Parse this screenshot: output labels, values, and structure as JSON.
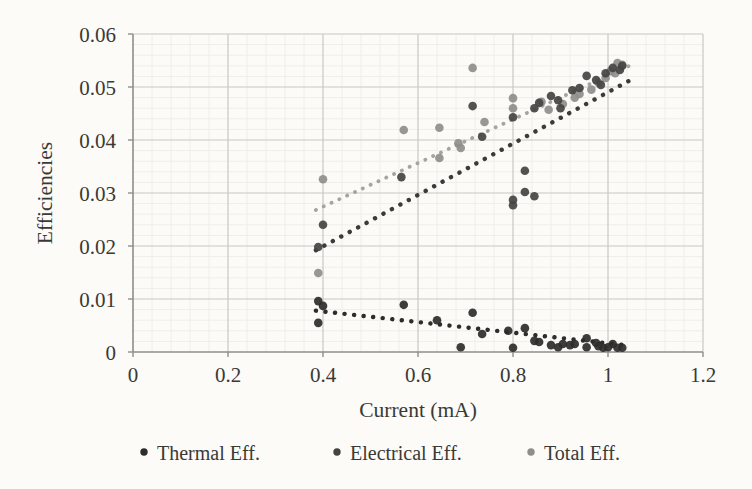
{
  "chart_data": {
    "type": "scatter",
    "title": "",
    "xlabel": "Current (mA)",
    "ylabel": "Efficiencies",
    "xlim": [
      0,
      1.2
    ],
    "ylim": [
      0,
      0.06
    ],
    "x_tick_values": [
      0,
      0.2,
      0.4,
      0.6,
      0.8,
      1,
      1.2
    ],
    "x_tick_labels": [
      "0",
      "0.2",
      "0.4",
      "0.6",
      "0.8",
      "1",
      "1.2"
    ],
    "y_tick_values": [
      0,
      0.01,
      0.02,
      0.03,
      0.04,
      0.05,
      0.06
    ],
    "y_tick_labels": [
      "0",
      "0.01",
      "0.02",
      "0.03",
      "0.04",
      "0.05",
      "0.06"
    ],
    "x_minor_unit": 0.04,
    "y_minor_unit": 0.002,
    "grid": "major+minor",
    "legend_position": "bottom",
    "series": [
      {
        "name": "Thermal Eff.",
        "marker": "circle",
        "color": "#2e2d2b",
        "trendline": {
          "style": "dotted",
          "color": "#2e2d2b",
          "x1": 0.385,
          "y1": 0.0078,
          "x2": 1.045,
          "y2": 0.0012
        },
        "points": [
          [
            0.39,
            0.0096
          ],
          [
            0.4,
            0.0087
          ],
          [
            0.39,
            0.0055
          ],
          [
            0.57,
            0.0089
          ],
          [
            0.64,
            0.006
          ],
          [
            0.69,
            0.0009
          ],
          [
            0.715,
            0.0074
          ],
          [
            0.735,
            0.0034
          ],
          [
            0.79,
            0.004
          ],
          [
            0.8,
            0.0008
          ],
          [
            0.825,
            0.0045
          ],
          [
            0.845,
            0.0021
          ],
          [
            0.855,
            0.0019
          ],
          [
            0.88,
            0.0013
          ],
          [
            0.895,
            0.0009
          ],
          [
            0.905,
            0.0015
          ],
          [
            0.92,
            0.0013
          ],
          [
            0.93,
            0.0015
          ],
          [
            0.955,
            0.0026
          ],
          [
            0.955,
            0.0009
          ],
          [
            0.975,
            0.0017
          ],
          [
            0.98,
            0.0011
          ],
          [
            0.99,
            0.0008
          ],
          [
            1.0,
            0.0009
          ],
          [
            1.01,
            0.0015
          ],
          [
            1.02,
            0.0008
          ],
          [
            1.03,
            0.0008
          ]
        ]
      },
      {
        "name": "Electrical Eff.",
        "marker": "circle",
        "color": "#454442",
        "trendline": {
          "style": "dotted",
          "color": "#3c3b39",
          "x1": 0.385,
          "y1": 0.0192,
          "x2": 1.045,
          "y2": 0.0512
        },
        "points": [
          [
            0.4,
            0.024
          ],
          [
            0.39,
            0.0198
          ],
          [
            0.565,
            0.033
          ],
          [
            0.715,
            0.0464
          ],
          [
            0.735,
            0.0406
          ],
          [
            0.8,
            0.0443
          ],
          [
            0.8,
            0.0287
          ],
          [
            0.8,
            0.0277
          ],
          [
            0.825,
            0.0302
          ],
          [
            0.825,
            0.0342
          ],
          [
            0.845,
            0.0294
          ],
          [
            0.855,
            0.047
          ],
          [
            0.845,
            0.046
          ],
          [
            0.88,
            0.0483
          ],
          [
            0.895,
            0.0475
          ],
          [
            0.9,
            0.046
          ],
          [
            0.925,
            0.0494
          ],
          [
            0.94,
            0.0498
          ],
          [
            0.955,
            0.0521
          ],
          [
            0.975,
            0.0513
          ],
          [
            0.985,
            0.0504
          ],
          [
            0.995,
            0.0526
          ],
          [
            1.01,
            0.0536
          ],
          [
            1.025,
            0.0532
          ],
          [
            1.03,
            0.054
          ]
        ]
      },
      {
        "name": "Total Eff.",
        "marker": "circle",
        "color": "#8f8e8a",
        "trendline": {
          "style": "dotted",
          "color": "#a5a4a0",
          "x1": 0.385,
          "y1": 0.0268,
          "x2": 1.045,
          "y2": 0.054
        },
        "points": [
          [
            0.4,
            0.0326
          ],
          [
            0.39,
            0.0149
          ],
          [
            0.57,
            0.0419
          ],
          [
            0.645,
            0.0423
          ],
          [
            0.645,
            0.0366
          ],
          [
            0.685,
            0.0394
          ],
          [
            0.69,
            0.0385
          ],
          [
            0.715,
            0.0536
          ],
          [
            0.74,
            0.0434
          ],
          [
            0.8,
            0.0479
          ],
          [
            0.8,
            0.046
          ],
          [
            0.86,
            0.0472
          ],
          [
            0.875,
            0.0457
          ],
          [
            0.905,
            0.0468
          ],
          [
            0.93,
            0.048
          ],
          [
            0.94,
            0.0487
          ],
          [
            0.965,
            0.0495
          ],
          [
            0.98,
            0.0508
          ],
          [
            0.995,
            0.0517
          ],
          [
            1.005,
            0.053
          ],
          [
            1.015,
            0.0526
          ],
          [
            1.02,
            0.0545
          ],
          [
            1.03,
            0.0542
          ]
        ]
      }
    ]
  },
  "palette": {
    "paper_background": "#fcfbf7",
    "major_gridline": "#c9c8c4",
    "minor_gridline": "#efeeea",
    "axis_line": "#8f8e8a",
    "text_color": "#3a3936"
  }
}
